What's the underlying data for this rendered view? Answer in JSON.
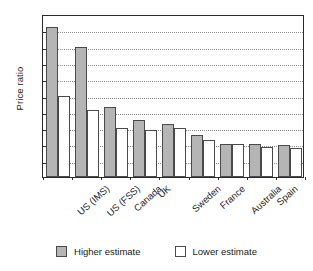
{
  "chart_data": {
    "type": "bar",
    "title": "",
    "xlabel": "",
    "ylabel": "Price ratio",
    "ylim": [
      0,
      5
    ],
    "ytick_step": 0.5,
    "ytick_labels": [
      "0",
      "0·5",
      "1",
      "1·5",
      "2",
      "2·5",
      "3",
      "3·5",
      "4",
      "4·5",
      "5"
    ],
    "ytick_values": [
      0,
      0.5,
      1,
      1.5,
      2,
      2.5,
      3,
      3.5,
      4,
      4.5,
      5
    ],
    "grid": "horizontal-dotted",
    "legend_position": "bottom-center",
    "categories": [
      "US (IMS)",
      "US (FSS)",
      "Canada",
      "UK",
      "Sweden",
      "France",
      "Australia",
      "Spain",
      "New Zealand"
    ],
    "series": [
      {
        "name": "Higher estimate",
        "color": "#b5b5b5",
        "values": [
          4.6,
          4.0,
          2.15,
          1.75,
          1.62,
          1.28,
          1.0,
          1.0,
          0.97
        ]
      },
      {
        "name": "Lower estimate",
        "color": "#ffffff",
        "values": [
          2.5,
          2.05,
          1.5,
          1.45,
          1.5,
          1.15,
          1.0,
          0.93,
          0.88
        ]
      }
    ]
  },
  "legend": {
    "items": [
      {
        "label": "Higher estimate",
        "swatch": "higher"
      },
      {
        "label": "Lower estimate",
        "swatch": "lower"
      }
    ]
  }
}
